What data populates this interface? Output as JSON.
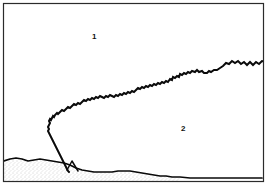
{
  "figure": {
    "title": "",
    "width": 268,
    "height": 188,
    "background_color": "#ffffff",
    "frame": {
      "stroke_color": "#2b2b2b",
      "stroke_width": 1.2,
      "x": 3,
      "y": 3,
      "width": 261,
      "height": 179
    },
    "labels": [
      {
        "id": "region-1",
        "text": "1",
        "x": 92,
        "y": 33
      },
      {
        "id": "region-2",
        "text": "2",
        "x": 181,
        "y": 125
      }
    ],
    "strokes": {
      "interface_color": "#0a0a0a",
      "interface_width": 2.0,
      "ground_color": "#0a0a0a",
      "ground_width": 1.6,
      "stipple_color": "#8f8f8f"
    },
    "paths": {
      "interface_curve": "M 267,62 L 262,61 L 259,64 L 256,62 L 253,65 L 250,62 L 247,65 L 244,62 L 241,64 L 238,61 L 235,63 L 232,61 L 229,64 L 226,63 L 223,66 L 220,68 L 217,70 L 214,70 L 211,72 L 209,71 L 207,73 L 204,73 L 202,71 L 199,72 L 197,70 L 195,72 L 192,71 L 190,73 L 188,72 L 186,74 L 184,73 L 182,75 L 180,74 L 179,77 L 177,76 L 175,78 L 173,77 L 172,80 L 170,79 L 168,82 L 166,81 L 164,83 L 162,82 L 160,84 L 158,83 L 156,85 L 154,84 L 152,86 L 150,85 L 148,87 L 146,86 L 144,88 L 142,87 L 140,89 L 138,88 L 136,90 L 134,92 L 132,91 L 130,93 L 128,92 L 126,94 L 124,93 L 122,95 L 120,94 L 118,96 L 116,95 L 114,97 L 112,96 L 110,95 L 108,97 L 106,96 L 104,98 L 102,97 L 100,96 L 98,98 L 96,97 L 94,99 L 92,98 L 90,100 L 88,99 L 86,101 L 84,100 L 82,102 L 80,104 L 78,103 L 76,105 L 74,104 L 72,106 L 70,108 L 68,107 L 66,109 L 64,111 L 62,110 L 60,112 L 58,114 L 57,113 L 55,115 L 54,117 L 53,116 L 52,118 L 51,120 L 50,119 L 49,121 L 50,123 L 49,125 L 48,127 L 49,129 L 48,131 L 49,133 L 50,135 L 51,137 L 52,139 L 53,141 L 54,143 L 55,145 L 56,147 L 57,149 L 58,151 L 59,153 L 60,155 L 61,157 L 62,159 L 63,161 L 64,163 L 65,165 L 66,167 L 67,169 L 68,171 L 69,172",
      "ground_line": "M 4,161 L 10,159 L 16,158 L 22,159 L 28,161 L 34,160 L 40,159 L 46,160 L 52,161 L 58,162 L 64,163 L 70,165 L 76,168 L 82,170 L 88,171 L 94,172 L 100,172 L 106,172 L 112,172 L 118,171 L 124,171 L 130,171 L 136,172 L 142,173 L 148,174 L 154,175 L 160,176 L 166,176 L 172,177 L 180,177 L 190,178 L 200,178 L 210,178 L 220,178 L 230,178 L 240,178 L 250,178 L 262,178",
      "spur_triangle": "M 67,170 L 72,161 L 78,171",
      "stipple_region": "M 4,161 L 10,159 L 16,158 L 22,159 L 28,161 L 34,160 L 40,159 L 46,160 L 52,161 L 58,162 L 64,163 L 70,165 L 76,168 L 82,170 L 88,171 L 94,172 L 100,172 L 106,172 L 112,172 L 118,171 L 124,171 L 130,171 L 136,172 L 142,173 L 148,174 L 154,175 L 160,176 L 166,176 L 172,177 L 180,177 L 180,181 L 4,181 Z"
    }
  }
}
